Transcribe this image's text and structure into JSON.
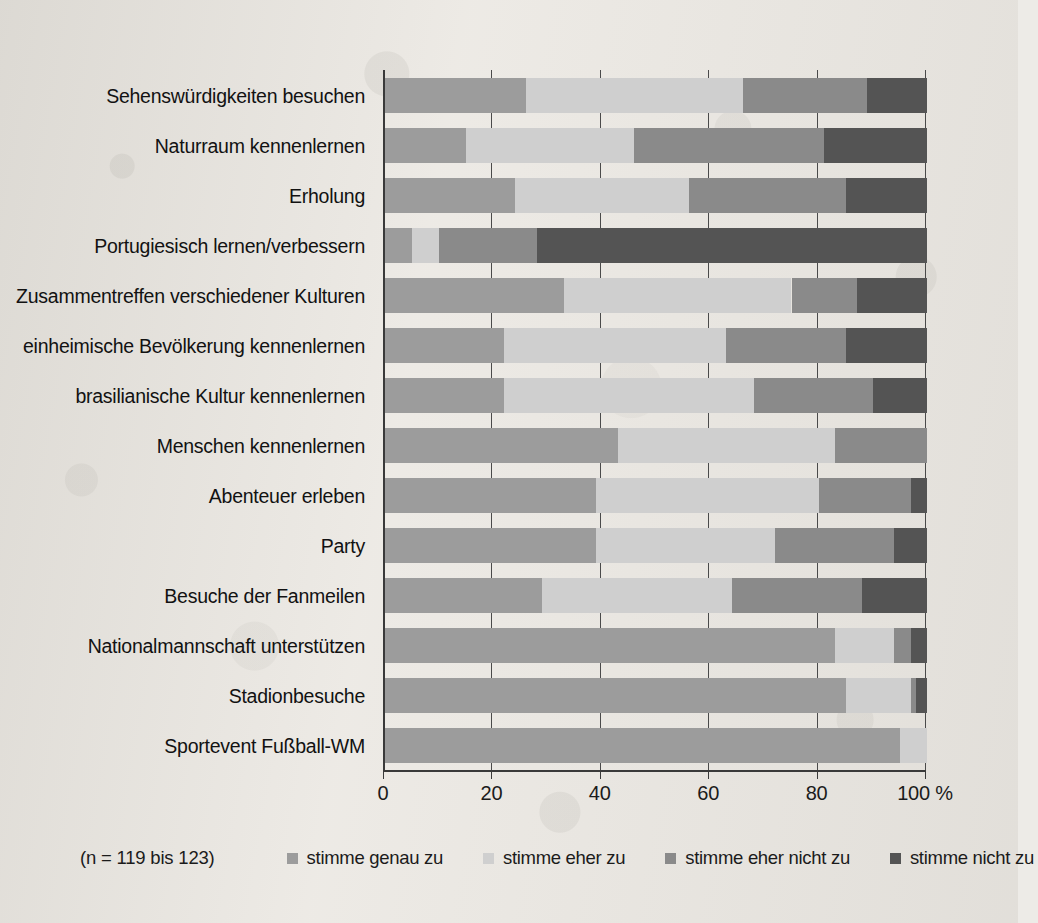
{
  "chart_data": {
    "type": "bar",
    "subtype": "stacked-horizontal-100-percent",
    "title": "",
    "xlabel": "",
    "ylabel": "",
    "xlim": [
      0,
      100
    ],
    "xticks": [
      0,
      20,
      40,
      60,
      80,
      100
    ],
    "xtick_labels": [
      "0",
      "20",
      "40",
      "60",
      "80",
      "100 %"
    ],
    "unit": "%",
    "grid": true,
    "grid_axis": "x",
    "legend_position": "bottom",
    "sample_note": "(n = 119 bis 123)",
    "categories": [
      "Sehenswürdigkeiten besuchen",
      "Naturraum kennenlernen",
      "Erholung",
      "Portugiesisch lernen/verbessern",
      "Zusammentreffen verschiedener Kulturen",
      "einheimische Bevölkerung kennenlernen",
      "brasilianische Kultur kennenlernen",
      "Menschen kennenlernen",
      "Abenteuer erleben",
      "Party",
      "Besuche der Fanmeilen",
      "Nationalmannschaft unterstützen",
      "Stadionbesuche",
      "Sportevent Fußball-WM"
    ],
    "series": [
      {
        "name": "stimme genau zu",
        "color": "#9c9c9c",
        "values": [
          26,
          15,
          24,
          5,
          33,
          22,
          22,
          43,
          39,
          39,
          29,
          83,
          85,
          95
        ]
      },
      {
        "name": "stimme eher zu",
        "color": "#cfcfcf",
        "values": [
          40,
          31,
          32,
          5,
          42,
          41,
          46,
          40,
          41,
          33,
          35,
          11,
          12,
          5
        ]
      },
      {
        "name": "stimme eher nicht zu",
        "color": "#8a8a8a",
        "values": [
          23,
          35,
          29,
          18,
          12,
          22,
          22,
          17,
          17,
          22,
          24,
          3,
          1,
          0
        ]
      },
      {
        "name": "stimme nicht zu",
        "color": "#545454",
        "values": [
          11,
          19,
          15,
          72,
          13,
          15,
          10,
          0,
          3,
          6,
          12,
          3,
          2,
          0
        ]
      }
    ]
  },
  "legend": {
    "items": [
      {
        "label": "stimme genau zu",
        "color": "#9c9c9c"
      },
      {
        "label": "stimme eher zu",
        "color": "#cfcfcf"
      },
      {
        "label": "stimme eher nicht zu",
        "color": "#8a8a8a"
      },
      {
        "label": "stimme nicht zu",
        "color": "#545454"
      }
    ]
  },
  "colors": {
    "background": "#edeae5",
    "axis": "#3a3a3a",
    "text": "#1b1b1b"
  }
}
